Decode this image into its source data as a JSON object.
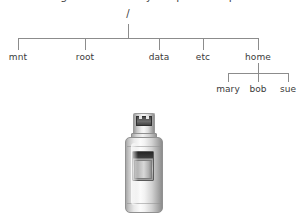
{
  "caption": {
    "partial_text": "igure 1-1: A very simple example"
  },
  "diagram": {
    "type": "filesystem-tree",
    "root": {
      "label": "/",
      "x": 128,
      "y": 14
    },
    "trunk": {
      "x": 128,
      "top": 24,
      "bottom": 38
    },
    "bar": {
      "y": 38,
      "left": 18,
      "right": 258
    },
    "level1": [
      {
        "label": "mnt",
        "x": 18,
        "drop_top": 38,
        "drop_bottom": 50,
        "label_y": 52
      },
      {
        "label": "root",
        "x": 85,
        "drop_top": 38,
        "drop_bottom": 50,
        "label_y": 52
      },
      {
        "label": "data",
        "x": 159,
        "drop_top": 38,
        "drop_bottom": 50,
        "label_y": 52
      },
      {
        "label": "etc",
        "x": 203,
        "drop_top": 38,
        "drop_bottom": 50,
        "label_y": 52
      },
      {
        "label": "home",
        "x": 258,
        "drop_top": 38,
        "drop_bottom": 50,
        "label_y": 52
      }
    ],
    "home_subtree": {
      "parent": "home",
      "stem": {
        "x": 258,
        "top": 63,
        "bottom": 73
      },
      "bar": {
        "y": 73,
        "left": 228,
        "right": 288
      },
      "children": [
        {
          "label": "mary",
          "x": 228,
          "drop_top": 73,
          "drop_bottom": 82,
          "label_y": 84
        },
        {
          "label": "bob",
          "x": 258,
          "drop_top": 73,
          "drop_bottom": 82,
          "label_y": 84
        },
        {
          "label": "sue",
          "x": 288,
          "drop_top": 73,
          "drop_bottom": 82,
          "label_y": 84
        }
      ]
    },
    "line_color": "#8c8c8c",
    "text_color": "#3a3a3a"
  },
  "illustration": {
    "name": "usb-flash-drive",
    "body_color": "#e9e9e9",
    "connector_color": "#4a4a4a",
    "outline_color": "#919191"
  }
}
